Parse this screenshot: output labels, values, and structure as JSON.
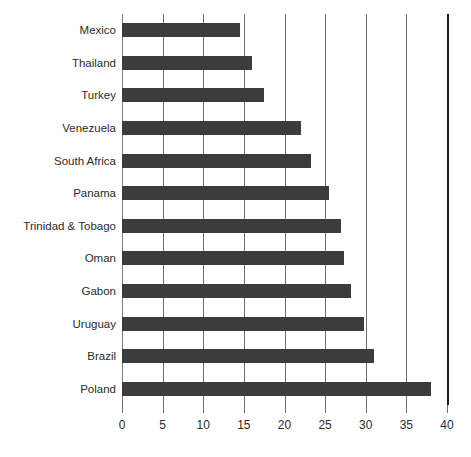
{
  "chart_data": {
    "type": "bar",
    "orientation": "horizontal",
    "title": "",
    "subtitle": "",
    "xlabel": "",
    "ylabel": "",
    "xlim": [
      0,
      40
    ],
    "xticks": [
      0,
      5,
      10,
      15,
      20,
      25,
      30,
      35,
      40
    ],
    "xtick_labels": [
      "0",
      "5",
      "10",
      "15",
      "20",
      "25",
      "30",
      "35",
      "40"
    ],
    "grid": true,
    "grid_axis": "x",
    "legend": false,
    "legend_position": "none",
    "bar_color": "#3c3c3c",
    "gridline_color": "#6e6e6e",
    "axis_end_color": "#1a1a1a",
    "background_color": "#ffffff",
    "categories": [
      "Mexico",
      "Thailand",
      "Turkey",
      "Venezuela",
      "South Africa",
      "Panama",
      "Trinidad & Tobago",
      "Oman",
      "Gabon",
      "Uruguay",
      "Brazil",
      "Poland"
    ],
    "values": [
      14.5,
      16.0,
      17.5,
      22.0,
      23.3,
      25.5,
      27.0,
      27.3,
      28.2,
      29.8,
      31.0,
      38.0
    ]
  }
}
